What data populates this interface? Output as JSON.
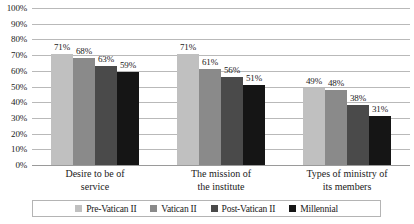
{
  "chart_data": {
    "type": "bar",
    "title": "",
    "xlabel": "",
    "ylabel": "",
    "ylim": [
      0,
      100
    ],
    "grid": true,
    "legend_position": "bottom",
    "value_suffix": "%",
    "categories": [
      "Desire to be of service",
      "The mission of the institute",
      "Types of ministry of its members"
    ],
    "category_lines": [
      [
        "Desire to be of",
        "service"
      ],
      [
        "The mission of",
        "the institute"
      ],
      [
        "Types of ministry of",
        "its members"
      ]
    ],
    "series": [
      {
        "name": "Pre-Vatican II",
        "color": "#c0c0c0",
        "values": [
          71,
          71,
          49
        ],
        "labels": [
          "71%",
          "71%",
          "49%"
        ]
      },
      {
        "name": "Vatican II",
        "color": "#8a8a8a",
        "values": [
          68,
          61,
          48
        ],
        "labels": [
          "68%",
          "61%",
          "48%"
        ]
      },
      {
        "name": "Post-Vatican II",
        "color": "#4a4a4a",
        "values": [
          63,
          56,
          38
        ],
        "labels": [
          "63%",
          "56%",
          "38%"
        ]
      },
      {
        "name": "Millennial",
        "color": "#151515",
        "values": [
          59,
          51,
          31
        ],
        "labels": [
          "59%",
          "51%",
          "31%"
        ]
      }
    ],
    "y_ticks": [
      "0%",
      "10%",
      "20%",
      "30%",
      "40%",
      "50%",
      "60%",
      "70%",
      "80%",
      "90%",
      "100%"
    ],
    "y_tick_values": [
      0,
      10,
      20,
      30,
      40,
      50,
      60,
      70,
      80,
      90,
      100
    ]
  }
}
